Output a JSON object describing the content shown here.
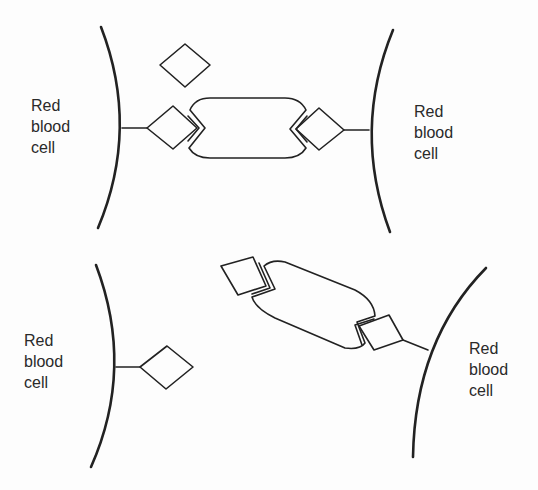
{
  "diagram": {
    "panels": [
      {
        "id": "top",
        "left_cell_label": [
          "Red",
          "blood",
          "cell"
        ],
        "right_cell_label": [
          "Red",
          "blood",
          "cell"
        ]
      },
      {
        "id": "bottom",
        "left_cell_label": [
          "Red",
          "blood",
          "cell"
        ],
        "right_cell_label": [
          "Red",
          "blood",
          "cell"
        ]
      }
    ],
    "colors": {
      "line": "#222222",
      "background": "#fdfdfd"
    }
  }
}
